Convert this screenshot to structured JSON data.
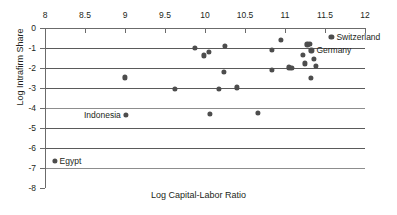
{
  "chart_data": {
    "type": "scatter",
    "title": "",
    "xlabel": "Log Capital-Labor Ratio",
    "ylabel": "Log Intrafirm Share",
    "xlim": [
      8,
      12
    ],
    "ylim": [
      -8,
      0
    ],
    "x_axis_position": "top",
    "xticks": [
      8,
      8.5,
      9,
      9.5,
      10,
      10.5,
      11,
      11.5,
      12
    ],
    "xtick_labels": [
      "8",
      "8.5",
      "9",
      "9.5",
      "10",
      "10.5",
      "11",
      "11.5",
      "12"
    ],
    "yticks": [
      0,
      -1,
      -2,
      -3,
      -4,
      -5,
      -6,
      -7,
      -8
    ],
    "ytick_labels": [
      "0",
      "-1",
      "-2",
      "-3",
      "-4",
      "-5",
      "-6",
      "-7",
      "-8"
    ],
    "gridlines": {
      "horizontal": [
        0,
        -1,
        -2,
        -3,
        -4,
        -5,
        -6,
        -7
      ],
      "vertical": []
    },
    "legend": "none",
    "marker_color": "#4d4d4d",
    "points": [
      {
        "x": 8.12,
        "y": -6.65,
        "label": "Egypt"
      },
      {
        "x": 9.0,
        "y": -2.47,
        "label": ""
      },
      {
        "x": 9.01,
        "y": -4.34,
        "label": "Indonesia"
      },
      {
        "x": 9.62,
        "y": -3.05,
        "label": ""
      },
      {
        "x": 9.87,
        "y": -1.0,
        "label": ""
      },
      {
        "x": 9.99,
        "y": -1.37,
        "label": ""
      },
      {
        "x": 10.05,
        "y": -1.2,
        "label": ""
      },
      {
        "x": 10.06,
        "y": -4.31,
        "label": ""
      },
      {
        "x": 10.17,
        "y": -3.05,
        "label": ""
      },
      {
        "x": 10.25,
        "y": -0.89,
        "label": ""
      },
      {
        "x": 10.24,
        "y": -2.18,
        "label": ""
      },
      {
        "x": 10.4,
        "y": -2.97,
        "label": ""
      },
      {
        "x": 10.66,
        "y": -4.24,
        "label": ""
      },
      {
        "x": 10.84,
        "y": -1.08,
        "label": ""
      },
      {
        "x": 10.84,
        "y": -2.1,
        "label": ""
      },
      {
        "x": 10.95,
        "y": -0.61,
        "label": ""
      },
      {
        "x": 11.05,
        "y": -1.97,
        "label": ""
      },
      {
        "x": 11.08,
        "y": -1.99,
        "label": ""
      },
      {
        "x": 11.22,
        "y": -1.34,
        "label": ""
      },
      {
        "x": 11.25,
        "y": -1.77,
        "label": ""
      },
      {
        "x": 11.28,
        "y": -0.82,
        "label": ""
      },
      {
        "x": 11.31,
        "y": -0.79,
        "label": ""
      },
      {
        "x": 11.33,
        "y": -1.12,
        "label": "Germany"
      },
      {
        "x": 11.32,
        "y": -2.48,
        "label": ""
      },
      {
        "x": 11.36,
        "y": -1.55,
        "label": ""
      },
      {
        "x": 11.39,
        "y": -1.9,
        "label": ""
      },
      {
        "x": 11.58,
        "y": -0.46,
        "label": "Switzerland"
      }
    ],
    "annotations": [
      {
        "text": "Switzerland",
        "x": 11.58,
        "y": -0.46,
        "placement": "right"
      },
      {
        "text": "Germany",
        "x": 11.33,
        "y": -1.12,
        "placement": "right"
      },
      {
        "text": "Indonesia",
        "x": 9.01,
        "y": -4.34,
        "placement": "left"
      },
      {
        "text": "Egypt",
        "x": 8.12,
        "y": -6.65,
        "placement": "right"
      }
    ]
  }
}
